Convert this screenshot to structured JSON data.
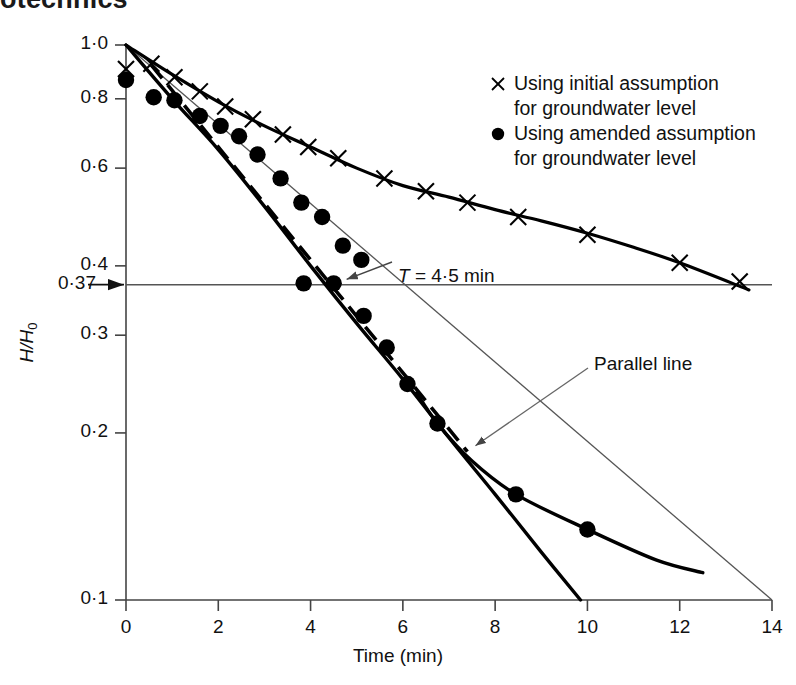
{
  "page_header_partial": "otechnics",
  "chart_data": {
    "type": "line",
    "title": "",
    "xlabel": "Time (min)",
    "ylabel": "H/H0",
    "ylabel_html": "H/H₀",
    "yscale": "log",
    "xscale": "linear",
    "xlim": [
      0,
      14
    ],
    "ylim": [
      0.1,
      1.0
    ],
    "xticks": [
      0,
      2,
      4,
      6,
      8,
      10,
      12,
      14
    ],
    "xticklabels": [
      "0",
      "2",
      "4",
      "6",
      "8",
      "10",
      "12",
      "14"
    ],
    "yticks": [
      1.0,
      0.8,
      0.6,
      0.4,
      0.3,
      0.2,
      0.1
    ],
    "yticklabels": [
      "1·0",
      "0·8",
      "0·6",
      "0·4",
      "0·3",
      "0·2",
      "0·1"
    ],
    "extra_ytick": {
      "value": 0.37,
      "label": "0·37"
    },
    "grid": false,
    "legend_position": "upper right",
    "series": [
      {
        "name": "Using initial assumption for groundwater level",
        "marker": "x",
        "marker_label": "×",
        "color": "#000000",
        "points": [
          {
            "x": 0.0,
            "y": 0.905
          },
          {
            "x": 0.55,
            "y": 0.925
          },
          {
            "x": 1.05,
            "y": 0.875
          },
          {
            "x": 1.6,
            "y": 0.825
          },
          {
            "x": 2.15,
            "y": 0.775
          },
          {
            "x": 2.75,
            "y": 0.735
          },
          {
            "x": 3.4,
            "y": 0.69
          },
          {
            "x": 3.95,
            "y": 0.655
          },
          {
            "x": 4.6,
            "y": 0.625
          },
          {
            "x": 5.6,
            "y": 0.575
          },
          {
            "x": 6.5,
            "y": 0.545
          },
          {
            "x": 7.4,
            "y": 0.52
          },
          {
            "x": 8.5,
            "y": 0.49
          },
          {
            "x": 10.0,
            "y": 0.455
          },
          {
            "x": 12.0,
            "y": 0.405
          },
          {
            "x": 13.3,
            "y": 0.375
          }
        ],
        "curve": [
          {
            "x": 0.0,
            "y": 1.0
          },
          {
            "x": 1.0,
            "y": 0.885
          },
          {
            "x": 2.0,
            "y": 0.79
          },
          {
            "x": 3.0,
            "y": 0.715
          },
          {
            "x": 4.0,
            "y": 0.655
          },
          {
            "x": 5.0,
            "y": 0.6
          },
          {
            "x": 6.0,
            "y": 0.558
          },
          {
            "x": 7.0,
            "y": 0.532
          },
          {
            "x": 8.0,
            "y": 0.505
          },
          {
            "x": 9.0,
            "y": 0.482
          },
          {
            "x": 10.0,
            "y": 0.458
          },
          {
            "x": 11.0,
            "y": 0.432
          },
          {
            "x": 12.0,
            "y": 0.405
          },
          {
            "x": 13.5,
            "y": 0.362
          }
        ]
      },
      {
        "name": "Using amended assumption for groundwater level",
        "marker": "o",
        "marker_label": "●",
        "color": "#000000",
        "points": [
          {
            "x": 0.0,
            "y": 0.865
          },
          {
            "x": 0.6,
            "y": 0.805
          },
          {
            "x": 1.05,
            "y": 0.795
          },
          {
            "x": 1.6,
            "y": 0.745
          },
          {
            "x": 2.05,
            "y": 0.715
          },
          {
            "x": 2.45,
            "y": 0.685
          },
          {
            "x": 2.85,
            "y": 0.635
          },
          {
            "x": 3.35,
            "y": 0.575
          },
          {
            "x": 3.8,
            "y": 0.52
          },
          {
            "x": 4.25,
            "y": 0.49
          },
          {
            "x": 4.7,
            "y": 0.435
          },
          {
            "x": 5.1,
            "y": 0.41
          },
          {
            "x": 3.85,
            "y": 0.372
          },
          {
            "x": 4.5,
            "y": 0.372
          },
          {
            "x": 5.15,
            "y": 0.325
          },
          {
            "x": 5.65,
            "y": 0.285
          },
          {
            "x": 6.1,
            "y": 0.245
          },
          {
            "x": 6.75,
            "y": 0.208
          },
          {
            "x": 8.45,
            "y": 0.155
          },
          {
            "x": 10.0,
            "y": 0.134
          }
        ],
        "curve": [
          {
            "x": 0.0,
            "y": 1.0
          },
          {
            "x": 1.0,
            "y": 0.8
          },
          {
            "x": 2.0,
            "y": 0.648
          },
          {
            "x": 3.0,
            "y": 0.512
          },
          {
            "x": 4.0,
            "y": 0.4
          },
          {
            "x": 5.0,
            "y": 0.315
          },
          {
            "x": 6.0,
            "y": 0.25
          },
          {
            "x": 7.0,
            "y": 0.196
          },
          {
            "x": 8.0,
            "y": 0.155
          },
          {
            "x": 9.0,
            "y": 0.122
          },
          {
            "x": 9.85,
            "y": 0.1
          }
        ],
        "curve_tail": [
          {
            "x": 6.3,
            "y": 0.236
          },
          {
            "x": 6.75,
            "y": 0.208
          },
          {
            "x": 7.5,
            "y": 0.178
          },
          {
            "x": 8.45,
            "y": 0.155
          },
          {
            "x": 10.0,
            "y": 0.134
          },
          {
            "x": 11.5,
            "y": 0.118
          },
          {
            "x": 12.5,
            "y": 0.112
          }
        ]
      }
    ],
    "reference_lines": [
      {
        "name": "level-0.37-line",
        "style": "solid-thin",
        "orientation": "horizontal",
        "y": 0.37,
        "x_from": 0.0,
        "x_to": 14.0,
        "label": "0·37"
      },
      {
        "name": "construction-line",
        "style": "solid-thin",
        "from": {
          "x": 0.0,
          "y": 1.0
        },
        "to": {
          "x": 14.0,
          "y": 0.1
        }
      },
      {
        "name": "parallel-line",
        "style": "dashed-thick",
        "from": {
          "x": 0.55,
          "y": 0.92
        },
        "to": {
          "x": 7.4,
          "y": 0.185
        }
      }
    ],
    "annotations": [
      {
        "name": "T-value",
        "text": "T = 4·5 min",
        "text_italic_prefix": "T",
        "text_rest": " = 4·5 min",
        "at": {
          "x": 4.5,
          "y": 0.372
        },
        "arrow": true
      },
      {
        "name": "parallel-line-callout",
        "text": "Parallel line",
        "at": {
          "x": 7.4,
          "y": 0.185
        },
        "arrow": true
      }
    ]
  },
  "legend": {
    "entries": [
      {
        "marker": "×",
        "marker_name": "cross-marker",
        "line1": "Using initial assumption",
        "line2": "for groundwater level"
      },
      {
        "marker": "●",
        "marker_name": "filled-circle-marker",
        "line1": "Using amended assumption",
        "line2": "for groundwater level"
      }
    ]
  },
  "axis": {
    "x_title": "Time (min)",
    "y_title_main": "H/H",
    "y_title_sub": "0"
  },
  "colors": {
    "ink": "#000000",
    "thin_line": "#555555",
    "background": "#ffffff"
  }
}
